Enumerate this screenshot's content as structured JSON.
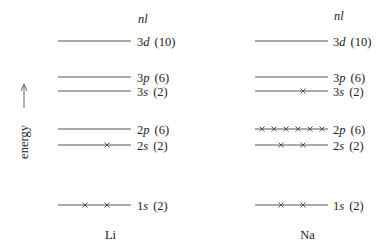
{
  "column_header": "nl",
  "axis": {
    "label": "energy",
    "direction": "up"
  },
  "colors": {
    "line": "#555555",
    "text": "#222222",
    "cross": "#444444"
  },
  "levels": [
    {
      "n": "3",
      "l": "d",
      "capacity": "(10)",
      "y": 41
    },
    {
      "n": "3",
      "l": "p",
      "capacity": "(6)",
      "y": 77
    },
    {
      "n": "3",
      "l": "s",
      "capacity": "(2)",
      "y": 91
    },
    {
      "n": "2",
      "l": "p",
      "capacity": "(6)",
      "y": 129
    },
    {
      "n": "2",
      "l": "s",
      "capacity": "(2)",
      "y": 145
    },
    {
      "n": "1",
      "l": "s",
      "capacity": "(2)",
      "y": 205
    }
  ],
  "atoms": [
    {
      "name": "Li",
      "x0": 58,
      "x1": 131,
      "label_x": 137,
      "electrons": {
        "3d": [],
        "3p": [],
        "3s": [],
        "2p": [],
        "2s": [
          107
        ],
        "1s": [
          85,
          107
        ]
      }
    },
    {
      "name": "Na",
      "x0": 255,
      "x1": 328,
      "label_x": 333,
      "electrons": {
        "3d": [],
        "3p": [],
        "3s": [
          303
        ],
        "2p": [
          262,
          274,
          286,
          298,
          310,
          322
        ],
        "2s": [
          281,
          303
        ],
        "1s": [
          281,
          303
        ]
      }
    }
  ]
}
